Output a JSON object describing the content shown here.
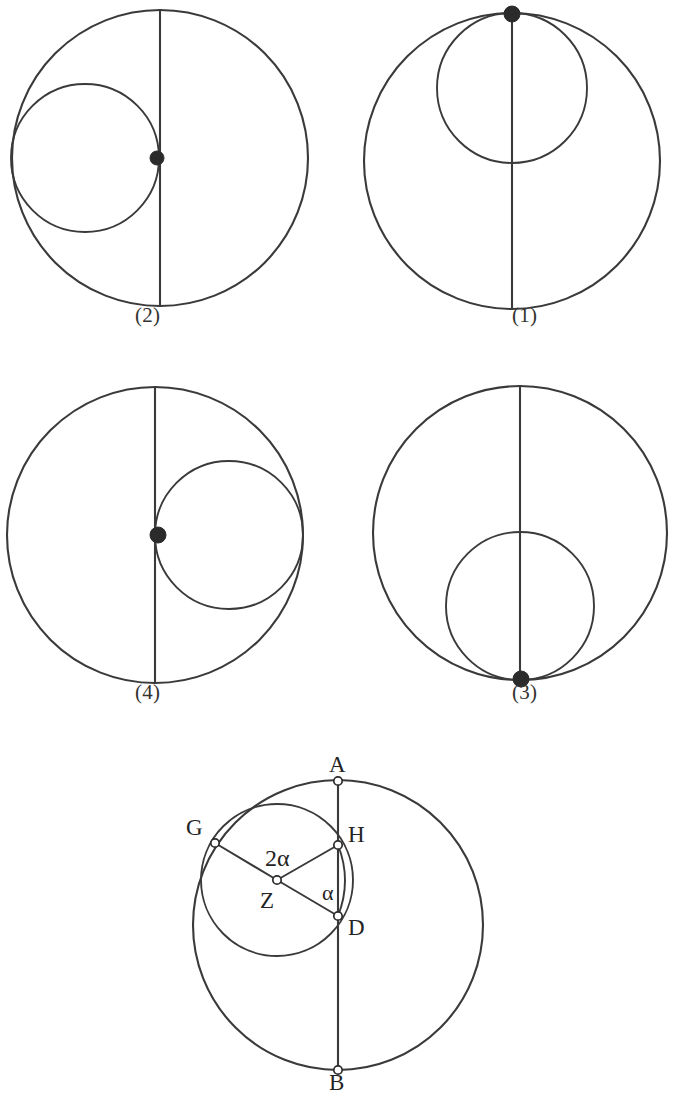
{
  "page": {
    "background_color": "#ffffff",
    "stroke_color": "#3a3a3a",
    "label_color": "#242424",
    "width": 675,
    "height": 1100
  },
  "figures": [
    {
      "id": "fig-2",
      "caption": "(2)",
      "caption_x": 135,
      "caption_y": 303,
      "outer": {
        "cx": 160,
        "cy": 158,
        "r": 148
      },
      "inner": {
        "cx": 85,
        "cy": 158,
        "r": 74
      },
      "diameter": {
        "x": 160,
        "y1": 10,
        "y2": 306
      },
      "marker": {
        "x": 157,
        "y": 158,
        "r": 7,
        "style": "filled"
      },
      "tangency": "left"
    },
    {
      "id": "fig-1",
      "caption": "(1)",
      "caption_x": 512,
      "caption_y": 303,
      "outer": {
        "cx": 512,
        "cy": 161,
        "r": 148
      },
      "inner": {
        "cx": 512,
        "cy": 88,
        "r": 75
      },
      "diameter": {
        "x": 512,
        "y1": 13,
        "y2": 309
      },
      "marker": {
        "x": 512,
        "y": 14,
        "r": 8,
        "style": "filled"
      },
      "tangency": "top"
    },
    {
      "id": "fig-4",
      "caption": "(4)",
      "caption_x": 135,
      "caption_y": 680,
      "outer": {
        "cx": 155,
        "cy": 535,
        "r": 148
      },
      "inner": {
        "cx": 229,
        "cy": 535,
        "r": 74
      },
      "diameter": {
        "x": 155,
        "y1": 387,
        "y2": 683
      },
      "marker": {
        "x": 158,
        "y": 535,
        "r": 8,
        "style": "filled"
      },
      "tangency": "right"
    },
    {
      "id": "fig-3",
      "caption": "(3)",
      "caption_x": 512,
      "caption_y": 680,
      "outer": {
        "cx": 520,
        "cy": 533,
        "r": 147
      },
      "inner": {
        "cx": 520,
        "cy": 606,
        "r": 74
      },
      "diameter": {
        "x": 520,
        "y1": 386,
        "y2": 680
      },
      "marker": {
        "x": 521,
        "y": 679,
        "r": 8,
        "style": "filled"
      },
      "tangency": "bottom"
    }
  ],
  "main_figure": {
    "id": "fig-angle",
    "outer": {
      "cx": 338,
      "cy": 925,
      "r": 145
    },
    "inner": {
      "cx": 277,
      "cy": 880,
      "r": 76
    },
    "diameter": {
      "x": 338,
      "y1": 781,
      "y2": 1070
    },
    "points": [
      {
        "name": "A",
        "x": 338,
        "y": 781,
        "label_x": 329,
        "label_y": 752,
        "style": "open"
      },
      {
        "name": "B",
        "x": 338,
        "y": 1070,
        "label_x": 329,
        "label_y": 1070,
        "style": "open"
      },
      {
        "name": "G",
        "x": 215,
        "y": 843,
        "label_x": 186,
        "label_y": 815,
        "style": "open"
      },
      {
        "name": "H",
        "x": 338,
        "y": 845,
        "label_x": 348,
        "label_y": 822,
        "style": "open"
      },
      {
        "name": "Z",
        "x": 277,
        "y": 880,
        "label_x": 260,
        "label_y": 888,
        "style": "open"
      },
      {
        "name": "D",
        "x": 338,
        "y": 916,
        "label_x": 348,
        "label_y": 915,
        "style": "open"
      }
    ],
    "segments": [
      {
        "from": "G",
        "to": "Z"
      },
      {
        "from": "Z",
        "to": "H"
      },
      {
        "from": "Z",
        "to": "D"
      }
    ],
    "angles": [
      {
        "label": "2α",
        "vertex": "Z",
        "label_x": 265,
        "label_y": 845
      },
      {
        "label": "α",
        "vertex": "D",
        "label_x": 322,
        "label_y": 880
      }
    ],
    "arc_HD": {
      "from_x": 338,
      "from_y": 845,
      "to_x": 338,
      "to_y": 916,
      "bulge": 14
    }
  }
}
